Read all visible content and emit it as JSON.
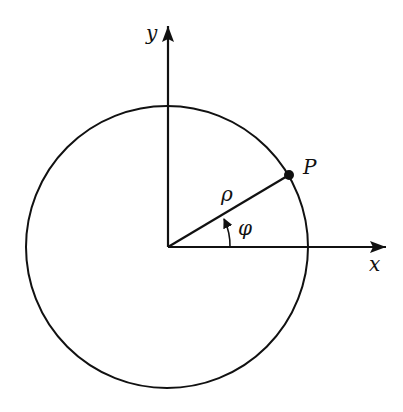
{
  "diagram": {
    "title": "",
    "labels": {
      "y_axis": "y",
      "x_axis": "x",
      "point": "P",
      "radius": "ρ",
      "angle": "φ"
    },
    "colors": {
      "stroke": "#111111",
      "background": "#ffffff"
    },
    "geometry": {
      "origin": [
        168,
        247
      ],
      "circle_radius": 141,
      "point_P": [
        289,
        175
      ],
      "angle_deg": 31
    }
  }
}
